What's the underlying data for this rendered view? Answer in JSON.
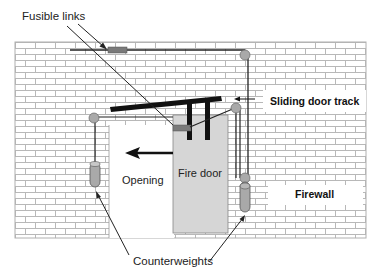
{
  "labels": {
    "fusible_links": "Fusible links",
    "sliding_door_track": "Sliding door track",
    "opening": "Opening",
    "fire_door": "Fire door",
    "firewall": "Firewall",
    "counterweights": "Counterweights"
  },
  "colors": {
    "brick_fill": "#ffffff",
    "brick_mortar": "#b8b8b8",
    "door_fill": "#d6d6d6",
    "fusible_link": "#7a7a7a",
    "pulley": "#a9a9a9",
    "track": "#111111",
    "cable": "#222222"
  }
}
